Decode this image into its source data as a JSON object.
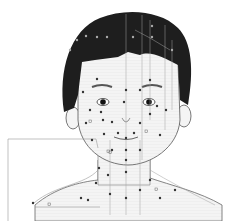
{
  "figure": {
    "colors": {
      "background": "#ffffff",
      "hair": "#1e1e1e",
      "skin": "#f2f2f2",
      "outline": "#555555",
      "meridian": "#9a9a9a",
      "point": "#333333",
      "callout": "#888888"
    }
  }
}
